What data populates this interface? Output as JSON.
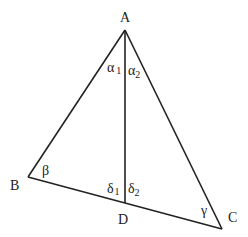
{
  "diagram": {
    "type": "triangle-with-altitude",
    "line_color": "#222222",
    "vertices": {
      "A": {
        "label": "A",
        "x": 125,
        "y": 30
      },
      "B": {
        "label": "B",
        "x": 28,
        "y": 177
      },
      "C": {
        "label": "C",
        "x": 222,
        "y": 229
      },
      "D": {
        "label": "D",
        "x": 125,
        "y": 203
      }
    },
    "segments": [
      {
        "from": "A",
        "to": "B"
      },
      {
        "from": "A",
        "to": "C"
      },
      {
        "from": "B",
        "to": "C"
      },
      {
        "from": "A",
        "to": "D"
      }
    ],
    "angles": {
      "alpha1": {
        "symbol": "α",
        "subscript": "1"
      },
      "alpha2": {
        "symbol": "α",
        "subscript": "2"
      },
      "beta": {
        "symbol": "β"
      },
      "gamma": {
        "symbol": "γ"
      },
      "delta1": {
        "symbol": "δ",
        "subscript": "1"
      },
      "delta2": {
        "symbol": "δ",
        "subscript": "2"
      }
    }
  }
}
